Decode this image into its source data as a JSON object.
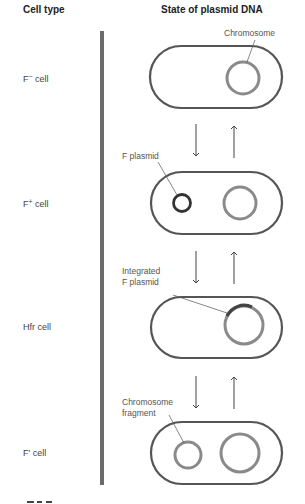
{
  "header": {
    "cell_type": "Cell type",
    "state": "State of plasmid DNA"
  },
  "rows": [
    {
      "label_base": "F",
      "label_sup": "−",
      "label_rest": " cell"
    },
    {
      "label_base": "F",
      "label_sup": "+",
      "label_rest": " cell"
    },
    {
      "label_base": "Hfr cell",
      "label_sup": "",
      "label_rest": ""
    },
    {
      "label_base": "F' cell",
      "label_sup": "",
      "label_rest": ""
    }
  ],
  "annotations": {
    "chromosome": "Chromosome",
    "f_plasmid": "F plasmid",
    "integrated_1": "Integrated",
    "integrated_2": "F plasmid",
    "fragment_1": "Chromosome",
    "fragment_2": "fragment"
  },
  "colors": {
    "cell_outline": "#555555",
    "chromosome": "#8a8a8a",
    "f_plasmid": "#333333",
    "bar": "#6b6b6b",
    "arrow": "#444444"
  },
  "figure_label": "7.20"
}
